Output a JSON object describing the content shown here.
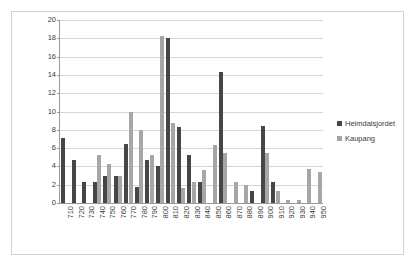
{
  "chart_data": {
    "type": "bar",
    "title": "",
    "subtitle": "",
    "xlabel": "",
    "ylabel": "",
    "ylim": [
      0,
      20
    ],
    "ytick_step": 2,
    "yticks": [
      0,
      2,
      4,
      6,
      8,
      10,
      12,
      14,
      16,
      18,
      20
    ],
    "grid": true,
    "legend_position": "right",
    "categories": [
      "710",
      "720",
      "730",
      "740",
      "750",
      "760",
      "770",
      "780",
      "790",
      "800",
      "810",
      "820",
      "830",
      "840",
      "850",
      "860",
      "870",
      "880",
      "890",
      "900",
      "910",
      "920",
      "930",
      "940",
      "950"
    ],
    "series": [
      {
        "name": "Heimdalsjordet",
        "color": "#464646",
        "values": [
          7.1,
          4.7,
          2.3,
          2.3,
          2.9,
          2.9,
          6.5,
          1.8,
          4.7,
          4.0,
          18.0,
          8.3,
          5.3,
          2.3,
          0,
          14.3,
          0,
          0,
          1.3,
          8.4,
          2.3,
          0,
          0,
          0,
          0
        ]
      },
      {
        "name": "Kaupang",
        "color": "#a6a6a6",
        "values": [
          0,
          0,
          0,
          5.3,
          4.3,
          2.9,
          10.0,
          8.0,
          5.3,
          18.3,
          8.7,
          1.6,
          2.3,
          3.6,
          6.3,
          5.5,
          2.3,
          2.0,
          0,
          5.5,
          1.3,
          0.3,
          0.3,
          3.7,
          3.4
        ]
      }
    ]
  },
  "legend": {
    "items": [
      {
        "label": "Heimdalsjordet",
        "color": "#464646"
      },
      {
        "label": "Kaupang",
        "color": "#a6a6a6"
      }
    ]
  }
}
